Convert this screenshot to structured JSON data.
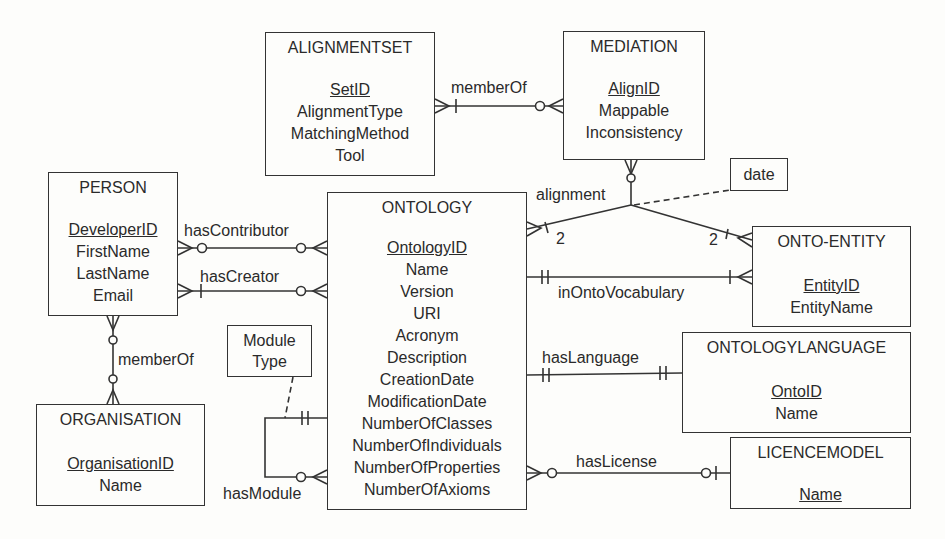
{
  "entities": {
    "alignmentset": {
      "title": "ALIGNMENTSET",
      "attrs": [
        "SetID",
        "AlignmentType",
        "MatchingMethod",
        "Tool"
      ]
    },
    "mediation": {
      "title": "MEDIATION",
      "attrs": [
        "AlignID",
        "Mappable",
        "Inconsistency"
      ]
    },
    "person": {
      "title": "PERSON",
      "attrs": [
        "DeveloperID",
        "FirstName",
        "LastName",
        "Email"
      ]
    },
    "ontology": {
      "title": "ONTOLOGY",
      "attrs": [
        "OntologyID",
        "Name",
        "Version",
        "URI",
        "Acronym",
        "Description",
        "CreationDate",
        "ModificationDate",
        "NumberOfClasses",
        "NumberOfIndividuals",
        "NumberOfProperties",
        "NumberOfAxioms"
      ]
    },
    "ontoentity": {
      "title": "ONTO-ENTITY",
      "attrs": [
        "EntityID",
        "EntityName"
      ]
    },
    "ontologylanguage": {
      "title": "ONTOLOGYLANGUAGE",
      "attrs": [
        "OntoID",
        "Name"
      ]
    },
    "licencemodel": {
      "title": "LICENCEMODEL",
      "attrs": [
        "Name"
      ]
    },
    "organisation": {
      "title": "ORGANISATION",
      "attrs": [
        "OrganisationID",
        "Name"
      ]
    }
  },
  "notes": {
    "date": "date",
    "module_type_line1": "Module",
    "module_type_line2": "Type"
  },
  "relationships": {
    "memberOf_alignment": "memberOf",
    "alignment": "alignment",
    "alignment_card_left": "2",
    "alignment_card_right": "2",
    "hasContributor": "hasContributor",
    "hasCreator": "hasCreator",
    "inOntoVocabulary": "inOntoVocabulary",
    "memberOf_org": "memberOf",
    "hasLanguage": "hasLanguage",
    "hasModule": "hasModule",
    "hasLicense": "hasLicense"
  },
  "colors": {
    "stroke": "#333333",
    "background": "#fdfdfb",
    "text": "#2a2a2a"
  }
}
